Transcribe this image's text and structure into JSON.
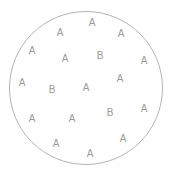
{
  "diagram": {
    "circle": {
      "cx": 85.5,
      "cy": 87.5,
      "r": 77,
      "stroke": "#b4b4b4"
    },
    "letter_color": "#9a9a9a",
    "letters": [
      {
        "text": "A",
        "x": 92,
        "y": 23
      },
      {
        "text": "A",
        "x": 60,
        "y": 33
      },
      {
        "text": "A",
        "x": 121,
        "y": 34
      },
      {
        "text": "A",
        "x": 32,
        "y": 51
      },
      {
        "text": "A",
        "x": 65,
        "y": 59
      },
      {
        "text": "B",
        "x": 100,
        "y": 56
      },
      {
        "text": "A",
        "x": 144,
        "y": 61
      },
      {
        "text": "A",
        "x": 22,
        "y": 83
      },
      {
        "text": "B",
        "x": 52,
        "y": 90
      },
      {
        "text": "A",
        "x": 86,
        "y": 88
      },
      {
        "text": "A",
        "x": 120,
        "y": 79
      },
      {
        "text": "B",
        "x": 110,
        "y": 113
      },
      {
        "text": "A",
        "x": 144,
        "y": 109
      },
      {
        "text": "A",
        "x": 32,
        "y": 119
      },
      {
        "text": "A",
        "x": 72,
        "y": 119
      },
      {
        "text": "A",
        "x": 123,
        "y": 139
      },
      {
        "text": "A",
        "x": 56,
        "y": 144
      },
      {
        "text": "A",
        "x": 90,
        "y": 154
      }
    ]
  }
}
